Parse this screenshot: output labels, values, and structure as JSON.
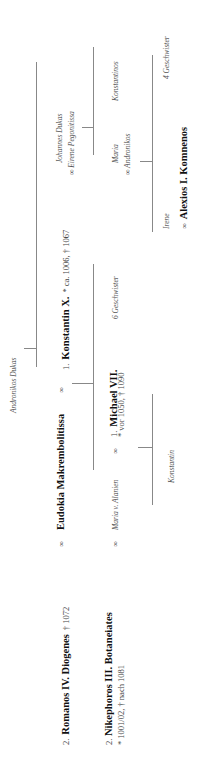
{
  "tree": {
    "ancestor": {
      "name": "Andronikos Dukas"
    },
    "romanos": {
      "num": "2.",
      "name": "Romanos IV. Diogenes",
      "dates": "† 1072"
    },
    "eudokia": {
      "name": "Eudokia Makrembolitissa"
    },
    "marriage_symbol": "∞",
    "konstantin": {
      "num": "1.",
      "name": "Konstantin X.",
      "dates": "* ca. 1006, † 1067"
    },
    "johannes": {
      "name": "Johannes Dukas",
      "spouse": "∞ Eirene Pegonitissa"
    },
    "nikephoros": {
      "num": "2.",
      "name": "Nikephoros III. Botaneiates",
      "dates": "* 1001/02, † nach 1081"
    },
    "maria_alanien": {
      "name": "Maria v. Alanien"
    },
    "michael": {
      "num": "1.",
      "name": "Michael VII.",
      "dates": "* vor 1050, † 1090"
    },
    "michael_siblings": "6 Geschwister",
    "maria": {
      "name": "Maria",
      "spouse": "∞ Andronikos"
    },
    "konstantinos": {
      "name": "Konstantinos"
    },
    "konstantin_son": {
      "name": "Konstantin"
    },
    "irene": {
      "name": "Irene"
    },
    "alexios": {
      "prefix": "∞",
      "name": "Alexios I. Komnenos"
    },
    "irene_siblings": "4 Geschwister"
  }
}
